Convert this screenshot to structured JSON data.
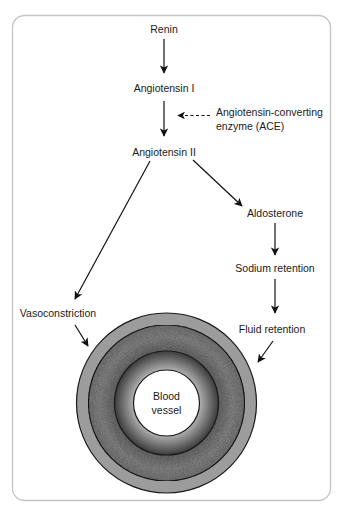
{
  "diagram": {
    "nodes": {
      "renin": "Renin",
      "angiotensin_1": "Angiotensin I",
      "angiotensin_2": "Angiotensin II",
      "ace_line1": "Angiotensin-converting",
      "ace_line2": "enzyme (ACE)",
      "aldosterone": "Aldosterone",
      "sodium_retention": "Sodium retention",
      "fluid_retention": "Fluid retention",
      "vasoconstriction": "Vasoconstriction",
      "vessel_line1": "Blood",
      "vessel_line2": "vessel"
    },
    "edges": [
      {
        "from": "Renin",
        "to": "Angiotensin I",
        "style": "solid"
      },
      {
        "from": "Angiotensin I",
        "to": "Angiotensin II",
        "style": "solid"
      },
      {
        "from": "Angiotensin-converting enzyme (ACE)",
        "to": "Angiotensin I → Angiotensin II",
        "style": "dashed"
      },
      {
        "from": "Angiotensin II",
        "to": "Vasoconstriction",
        "style": "solid"
      },
      {
        "from": "Angiotensin II",
        "to": "Aldosterone",
        "style": "solid"
      },
      {
        "from": "Aldosterone",
        "to": "Sodium retention",
        "style": "solid"
      },
      {
        "from": "Sodium retention",
        "to": "Fluid retention",
        "style": "solid"
      },
      {
        "from": "Vasoconstriction",
        "to": "Blood vessel",
        "style": "solid"
      },
      {
        "from": "Fluid retention",
        "to": "Blood vessel",
        "style": "solid"
      }
    ],
    "colors": {
      "frame_border": "#c4c4c4",
      "outer_ring": "#9a9a9a",
      "textured_ring": "#7d7d7d",
      "inner_ring_dark": "#4a4a4a",
      "inner_ring_light": "#a8a8a8",
      "lumen": "#ffffff",
      "ring_stroke": "#1a1a1a",
      "arrow": "#111111"
    }
  }
}
